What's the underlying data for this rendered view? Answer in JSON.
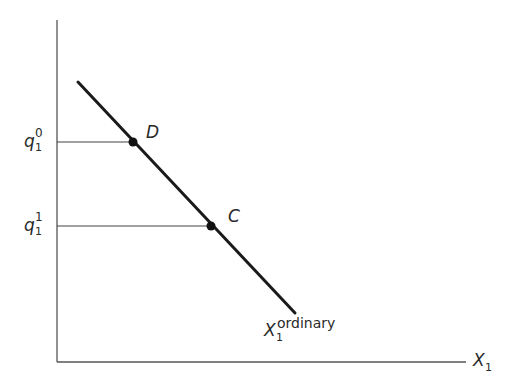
{
  "diagram": {
    "type": "demand-curve",
    "axes": {
      "x_label": {
        "base": "X",
        "sub": "1"
      }
    },
    "curve": {
      "label": {
        "base": "X",
        "sub": "1",
        "sup": "ordinary"
      },
      "start": [
        78,
        82
      ],
      "end": [
        295,
        313
      ]
    },
    "points": [
      {
        "name": "D",
        "y_label": {
          "base": "q",
          "sub": "1",
          "sup": "0"
        }
      },
      {
        "name": "C",
        "y_label": {
          "base": "q",
          "sub": "1",
          "sup": "1"
        }
      }
    ],
    "colors": {
      "line": "#1a1a1a",
      "axis": "#555555",
      "guide": "#444444"
    }
  }
}
